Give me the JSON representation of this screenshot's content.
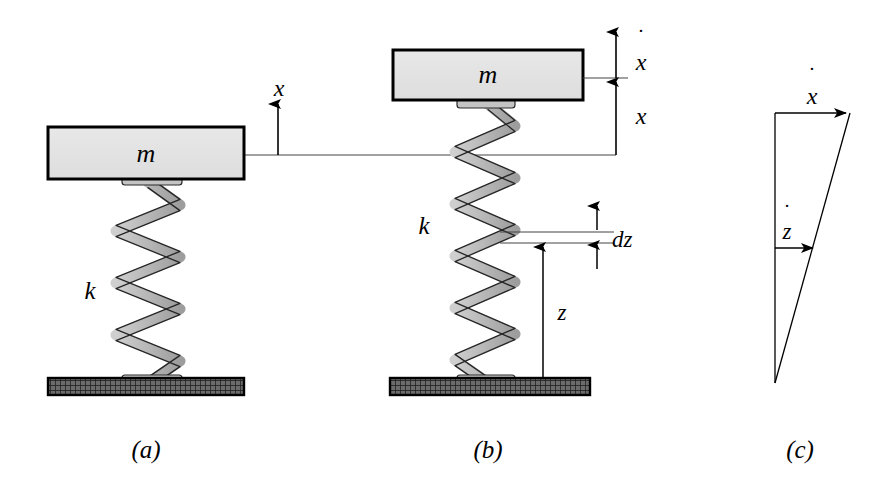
{
  "figure": {
    "background_color": "#ffffff",
    "line_color": "#000000",
    "mass_fill_color": "#e2e2e2",
    "spring_fill_color": "#b5b5b5",
    "ground_fill_color": "#4a4a4a",
    "width": 886,
    "height": 489
  },
  "panels": {
    "a": {
      "caption": "(a)",
      "mass_label": "m",
      "spring_label": "k",
      "displacement_label": "x"
    },
    "b": {
      "caption": "(b)",
      "mass_label": "m",
      "spring_label": "k",
      "velocity_label": "x",
      "velocity_dot": "˙",
      "displacement_label": "x",
      "element_label": "dz",
      "height_label": "z"
    },
    "c": {
      "caption": "(c)",
      "top_vector_label": "x",
      "top_vector_dot": "˙",
      "mid_vector_label": "z",
      "mid_vector_dot": "˙"
    }
  }
}
